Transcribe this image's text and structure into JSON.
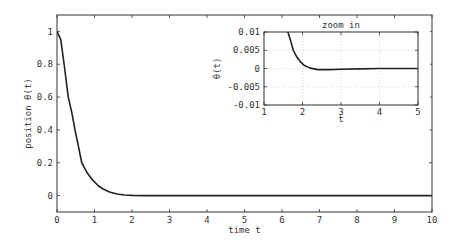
{
  "chart_data": [
    {
      "type": "line",
      "title": "",
      "xlabel": "time t",
      "ylabel": "position θ(t)",
      "xlim": [
        0,
        10
      ],
      "ylim": [
        -0.1,
        1.1
      ],
      "xticks": [
        0,
        1,
        2,
        3,
        4,
        5,
        6,
        7,
        8,
        9,
        10
      ],
      "yticks": [
        0,
        0.2,
        0.4,
        0.6,
        0.8,
        1
      ],
      "ytick_labels": [
        "0",
        "0.2",
        "0.4",
        "0.6",
        "0.8",
        "1"
      ],
      "grid": false,
      "series": [
        {
          "name": "θ(t)",
          "color": "#222222",
          "x": [
            0,
            0.1,
            0.19,
            0.3,
            0.4,
            0.48,
            0.58,
            0.66,
            0.8,
            0.93,
            1.1,
            1.23,
            1.4,
            1.6,
            1.8,
            2.0,
            2.4,
            3,
            4,
            5,
            6,
            7,
            8,
            9,
            10
          ],
          "y": [
            1,
            0.95,
            0.8,
            0.6,
            0.5,
            0.4,
            0.29,
            0.2,
            0.14,
            0.1,
            0.06,
            0.04,
            0.022,
            0.01,
            0.004,
            0.001,
            -0.0003,
            -0.0001,
            0,
            0,
            0,
            0,
            0,
            0,
            0
          ]
        }
      ]
    },
    {
      "type": "line",
      "title": "zoom in",
      "xlabel": "t",
      "ylabel": "θ(t)",
      "xlim": [
        1,
        5
      ],
      "ylim": [
        -0.01,
        0.01
      ],
      "xticks": [
        1,
        2,
        3,
        4,
        5
      ],
      "yticks": [
        -0.01,
        -0.005,
        0,
        0.005,
        0.01
      ],
      "ytick_labels": [
        "-0.01",
        "-0.005",
        "0",
        "0.005",
        "0.01"
      ],
      "grid": true,
      "series": [
        {
          "name": "θ(t)",
          "color": "#222222",
          "x": [
            1.55,
            1.62,
            1.7,
            1.76,
            1.85,
            1.95,
            2.05,
            2.2,
            2.4,
            2.7,
            3,
            3.5,
            4,
            4.5,
            5
          ],
          "y": [
            0.014,
            0.01,
            0.0073,
            0.005,
            0.0032,
            0.0018,
            0.0008,
            0.0001,
            -0.0003,
            -0.0003,
            -0.0002,
            -0.0001,
            0,
            0,
            0
          ]
        }
      ]
    }
  ]
}
